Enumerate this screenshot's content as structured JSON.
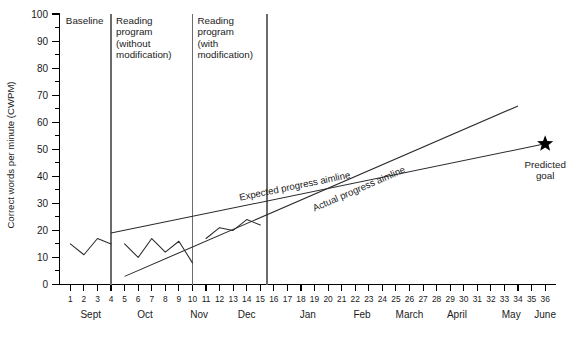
{
  "chart_data": {
    "type": "line",
    "title": "",
    "xlabel": "",
    "ylabel": "Correct words per minute (CWPM)",
    "ylim": [
      0,
      100
    ],
    "xlim": [
      0.2,
      36.8
    ],
    "grid": false,
    "legend_position": "inline-annotations",
    "y_ticks": [
      0,
      10,
      20,
      30,
      40,
      50,
      60,
      70,
      80,
      90,
      100
    ],
    "y_minor_ticks": [
      5,
      15,
      25,
      35,
      45,
      55,
      65,
      75,
      85,
      95
    ],
    "x_ticks": [
      1,
      2,
      3,
      4,
      5,
      6,
      7,
      8,
      9,
      10,
      11,
      12,
      13,
      14,
      15,
      16,
      17,
      18,
      19,
      20,
      21,
      22,
      23,
      24,
      25,
      26,
      27,
      28,
      29,
      30,
      31,
      32,
      33,
      34,
      35,
      36
    ],
    "months": [
      {
        "label": "Sept",
        "center_week": 2.5
      },
      {
        "label": "Oct",
        "center_week": 6.5
      },
      {
        "label": "Nov",
        "center_week": 10.5
      },
      {
        "label": "Dec",
        "center_week": 14.0
      },
      {
        "label": "Jan",
        "center_week": 18.5
      },
      {
        "label": "Feb",
        "center_week": 22.5
      },
      {
        "label": "March",
        "center_week": 26.0
      },
      {
        "label": "April",
        "center_week": 29.5
      },
      {
        "label": "May",
        "center_week": 33.5
      },
      {
        "label": "June",
        "center_week": 36.0
      }
    ],
    "series": [
      {
        "name": "Student performance data",
        "type": "line",
        "x": [
          1,
          2,
          3,
          4
        ],
        "values": [
          15,
          11,
          17,
          15
        ],
        "phase": "Baseline"
      },
      {
        "name": "Student performance data",
        "type": "line",
        "x": [
          5,
          6,
          7,
          8,
          9,
          10
        ],
        "values": [
          15,
          10,
          17,
          12,
          16,
          8
        ],
        "phase": "Reading program (without modification)"
      },
      {
        "name": "Student performance data",
        "type": "line",
        "x": [
          11,
          12,
          13,
          14,
          15
        ],
        "values": [
          17,
          21,
          20,
          24,
          22
        ],
        "phase": "Reading program (with modification)"
      }
    ],
    "aimlines": [
      {
        "name": "Expected progress aimline",
        "label": "Expected progress aimline",
        "x_start": 4,
        "y_start": 19,
        "x_end": 36,
        "y_end": 52,
        "label_x": 13.5,
        "label_y": 31
      },
      {
        "name": "Actual progress aimline",
        "label": "Actual progress aimline",
        "x_start": 5,
        "y_start": 3,
        "x_end": 34,
        "y_end": 66,
        "label_x": 19.0,
        "label_y": 27
      }
    ],
    "markers": [
      {
        "name": "predicted-goal",
        "glyph": "star",
        "x": 36,
        "y": 52,
        "label_line1": "Predicted",
        "label_line2": "goal"
      }
    ],
    "phases": [
      {
        "name": "baseline",
        "lines": [
          "Baseline"
        ],
        "start_week": 0.3,
        "end_week": 4.0
      },
      {
        "name": "reading-program-without-modification",
        "lines": [
          "Reading",
          "program",
          "(without",
          "modification)"
        ],
        "start_week": 4.0,
        "end_week": 10.0
      },
      {
        "name": "reading-program-with-modification",
        "lines": [
          "Reading",
          "program",
          "(with",
          "modification)"
        ],
        "start_week": 10.0,
        "end_week": 15.5
      }
    ],
    "phase_dividers": [
      4.0,
      10.0,
      15.5
    ]
  },
  "colors": {
    "line": "#2a2a2a",
    "axis": "#000000",
    "phase_divider": "#6b6b6b",
    "marker": "#000000",
    "background": "#ffffff"
  }
}
